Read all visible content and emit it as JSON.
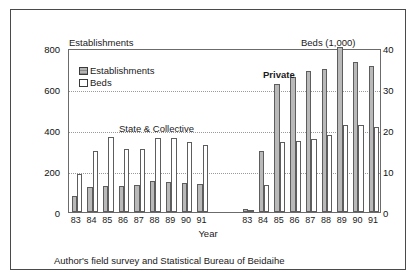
{
  "figure": {
    "left_axis_caption": "Establishments",
    "right_axis_caption": "Beds (1,000)",
    "xaxis_title": "Year",
    "source_note": "Author's field survey and Statistical Bureau of Beidaihe",
    "top_bleed": "",
    "legend": [
      {
        "label": "Establishments",
        "swatch": "hatched-gray-swatch"
      },
      {
        "label": "Beds",
        "swatch": "white-swatch"
      }
    ],
    "group_annotations": [
      {
        "label": "State & Collective"
      },
      {
        "label": "Private"
      }
    ]
  },
  "chart_data": {
    "type": "bar",
    "xlabel": "Year",
    "ylabel": "Establishments",
    "y2label": "Beds (1,000)",
    "ylim": [
      0,
      800
    ],
    "y2lim": [
      0,
      40
    ],
    "yticks": [
      0,
      200,
      400,
      600,
      800
    ],
    "y2ticks": [
      0,
      10,
      20,
      30,
      40
    ],
    "grid": "horizontal-dotted",
    "legend_position": "inside-top-left",
    "groups": [
      {
        "name": "State & Collective",
        "categories": [
          "83",
          "84",
          "85",
          "86",
          "87",
          "88",
          "89",
          "90",
          "91"
        ],
        "series": [
          {
            "name": "Establishments",
            "axis": "left",
            "values": [
              80,
              122,
              127,
              128,
              130,
              150,
              148,
              143,
              138
            ]
          },
          {
            "name": "Beds",
            "axis": "right",
            "values": [
              9.2,
              15.0,
              18.2,
              15.3,
              15.4,
              18.1,
              18.0,
              17.1,
              16.4
            ]
          }
        ]
      },
      {
        "name": "Private",
        "categories": [
          "83",
          "84",
          "85",
          "86",
          "87",
          "88",
          "89",
          "90",
          "91"
        ],
        "series": [
          {
            "name": "Establishments",
            "axis": "left",
            "values": [
              15,
              297,
              625,
              660,
              690,
              697,
              805,
              733,
              712
            ]
          },
          {
            "name": "Beds",
            "axis": "right",
            "values": [
              0.5,
              6.5,
              17.0,
              17.2,
              17.8,
              18.7,
              21.3,
              21.3,
              20.7
            ]
          }
        ]
      }
    ]
  }
}
